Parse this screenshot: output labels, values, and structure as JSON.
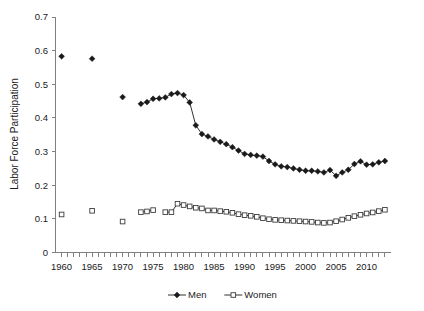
{
  "chart_data": {
    "type": "line",
    "title": "",
    "xlabel": "",
    "ylabel": "Labor Force Participation",
    "xlim": [
      1959.0,
      2014.0
    ],
    "ylim": [
      0,
      0.7
    ],
    "grid": false,
    "legend_position": "bottom-center",
    "y_ticks": [
      "0",
      "0.1",
      "0.2",
      "0.3",
      "0.4",
      "0.5",
      "0.6",
      "0.7"
    ],
    "y_tick_values": [
      0,
      0.1,
      0.2,
      0.3,
      0.4,
      0.5,
      0.6,
      0.7
    ],
    "x_tick_labels": [
      "1960",
      "1965",
      "1970",
      "1975",
      "1980",
      "1985",
      "1990",
      "1995",
      "2000",
      "2005",
      "2010"
    ],
    "x_tick_label_values": [
      1960,
      1965,
      1970,
      1975,
      1980,
      1985,
      1990,
      1995,
      2000,
      2005,
      2010
    ],
    "x_minor_tick_values": [
      1960,
      1961,
      1962,
      1963,
      1964,
      1965,
      1966,
      1967,
      1968,
      1969,
      1970,
      1971,
      1972,
      1973,
      1974,
      1975,
      1976,
      1977,
      1978,
      1979,
      1980,
      1981,
      1982,
      1983,
      1984,
      1985,
      1986,
      1987,
      1988,
      1989,
      1990,
      1991,
      1992,
      1993,
      1994,
      1995,
      1996,
      1997,
      1998,
      1999,
      2000,
      2001,
      2002,
      2003,
      2004,
      2005,
      2006,
      2007,
      2008,
      2009,
      2010,
      2011,
      2012,
      2013
    ],
    "series": [
      {
        "name": "Men",
        "marker": "filled-diamond",
        "color": "#1a1a1a",
        "connected": true,
        "points": [
          {
            "x": 1960,
            "y": 0.583
          },
          {
            "x": 1965,
            "y": 0.576
          },
          {
            "x": 1970,
            "y": 0.462
          },
          {
            "x": 1973,
            "y": 0.442
          },
          {
            "x": 1974,
            "y": 0.447
          },
          {
            "x": 1975,
            "y": 0.457
          },
          {
            "x": 1976,
            "y": 0.458
          },
          {
            "x": 1977,
            "y": 0.461
          },
          {
            "x": 1978,
            "y": 0.471
          },
          {
            "x": 1979,
            "y": 0.474
          },
          {
            "x": 1980,
            "y": 0.468
          },
          {
            "x": 1981,
            "y": 0.446
          },
          {
            "x": 1982,
            "y": 0.378
          },
          {
            "x": 1983,
            "y": 0.352
          },
          {
            "x": 1984,
            "y": 0.345
          },
          {
            "x": 1985,
            "y": 0.336
          },
          {
            "x": 1986,
            "y": 0.329
          },
          {
            "x": 1987,
            "y": 0.322
          },
          {
            "x": 1988,
            "y": 0.313
          },
          {
            "x": 1989,
            "y": 0.303
          },
          {
            "x": 1990,
            "y": 0.293
          },
          {
            "x": 1991,
            "y": 0.29
          },
          {
            "x": 1992,
            "y": 0.288
          },
          {
            "x": 1993,
            "y": 0.285
          },
          {
            "x": 1994,
            "y": 0.272
          },
          {
            "x": 1995,
            "y": 0.262
          },
          {
            "x": 1996,
            "y": 0.256
          },
          {
            "x": 1997,
            "y": 0.254
          },
          {
            "x": 1998,
            "y": 0.25
          },
          {
            "x": 1999,
            "y": 0.246
          },
          {
            "x": 2000,
            "y": 0.243
          },
          {
            "x": 2001,
            "y": 0.243
          },
          {
            "x": 2002,
            "y": 0.241
          },
          {
            "x": 2003,
            "y": 0.238
          },
          {
            "x": 2004,
            "y": 0.245
          },
          {
            "x": 2005,
            "y": 0.228
          },
          {
            "x": 2006,
            "y": 0.238
          },
          {
            "x": 2007,
            "y": 0.246
          },
          {
            "x": 2008,
            "y": 0.263
          },
          {
            "x": 2009,
            "y": 0.271
          },
          {
            "x": 2010,
            "y": 0.261
          },
          {
            "x": 2011,
            "y": 0.262
          },
          {
            "x": 2012,
            "y": 0.268
          },
          {
            "x": 2013,
            "y": 0.272
          }
        ]
      },
      {
        "name": "Women",
        "marker": "open-square",
        "color": "#ffffff",
        "connected": true,
        "points": [
          {
            "x": 1960,
            "y": 0.113
          },
          {
            "x": 1965,
            "y": 0.124
          },
          {
            "x": 1970,
            "y": 0.092
          },
          {
            "x": 1973,
            "y": 0.12
          },
          {
            "x": 1974,
            "y": 0.122
          },
          {
            "x": 1975,
            "y": 0.126
          },
          {
            "x": 1977,
            "y": 0.12
          },
          {
            "x": 1978,
            "y": 0.12
          },
          {
            "x": 1979,
            "y": 0.145
          },
          {
            "x": 1980,
            "y": 0.141
          },
          {
            "x": 1981,
            "y": 0.137
          },
          {
            "x": 1982,
            "y": 0.133
          },
          {
            "x": 1983,
            "y": 0.131
          },
          {
            "x": 1984,
            "y": 0.125
          },
          {
            "x": 1985,
            "y": 0.125
          },
          {
            "x": 1986,
            "y": 0.123
          },
          {
            "x": 1987,
            "y": 0.121
          },
          {
            "x": 1988,
            "y": 0.118
          },
          {
            "x": 1989,
            "y": 0.114
          },
          {
            "x": 1990,
            "y": 0.111
          },
          {
            "x": 1991,
            "y": 0.109
          },
          {
            "x": 1992,
            "y": 0.106
          },
          {
            "x": 1993,
            "y": 0.102
          },
          {
            "x": 1994,
            "y": 0.099
          },
          {
            "x": 1995,
            "y": 0.097
          },
          {
            "x": 1996,
            "y": 0.096
          },
          {
            "x": 1997,
            "y": 0.095
          },
          {
            "x": 1998,
            "y": 0.094
          },
          {
            "x": 1999,
            "y": 0.093
          },
          {
            "x": 2000,
            "y": 0.092
          },
          {
            "x": 2001,
            "y": 0.091
          },
          {
            "x": 2002,
            "y": 0.089
          },
          {
            "x": 2003,
            "y": 0.088
          },
          {
            "x": 2004,
            "y": 0.089
          },
          {
            "x": 2005,
            "y": 0.093
          },
          {
            "x": 2006,
            "y": 0.098
          },
          {
            "x": 2007,
            "y": 0.103
          },
          {
            "x": 2008,
            "y": 0.108
          },
          {
            "x": 2009,
            "y": 0.112
          },
          {
            "x": 2010,
            "y": 0.116
          },
          {
            "x": 2011,
            "y": 0.119
          },
          {
            "x": 2012,
            "y": 0.123
          },
          {
            "x": 2013,
            "y": 0.127
          }
        ]
      }
    ],
    "legend": [
      {
        "label": "Men",
        "marker": "filled-diamond"
      },
      {
        "label": "Women",
        "marker": "open-square"
      }
    ]
  }
}
